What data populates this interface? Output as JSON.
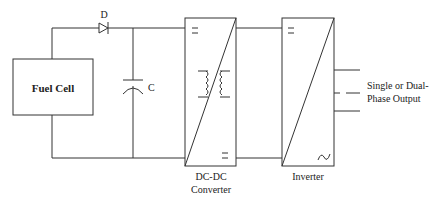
{
  "diagram": {
    "components": {
      "fuel_cell": {
        "label": "Fuel Cell"
      },
      "diode": {
        "label": "D"
      },
      "capacitor": {
        "label": "C"
      },
      "dcdc": {
        "label_line1": "DC-DC",
        "label_line2": "Converter"
      },
      "inverter": {
        "label": "Inverter"
      },
      "output": {
        "label_line1": "Single or Dual-",
        "label_line2": "Phase Output"
      }
    },
    "colors": {
      "line": "#333333",
      "background": "#ffffff"
    }
  }
}
